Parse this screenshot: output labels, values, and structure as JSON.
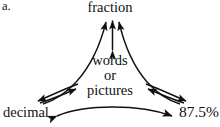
{
  "item_letter": "a.",
  "diagram": {
    "type": "concept-map-triangle",
    "stroke_color": "#111111",
    "background_color": "#ffffff",
    "nodes": [
      {
        "id": "fraction",
        "label": "fraction",
        "position": "top"
      },
      {
        "id": "center",
        "label": "words or pictures",
        "position": "center",
        "lines": [
          "words",
          "or",
          "pictures"
        ]
      },
      {
        "id": "decimal",
        "label": "decimal",
        "position": "bottom-left"
      },
      {
        "id": "percent",
        "label": "87.5%",
        "position": "bottom-right"
      }
    ],
    "connections": [
      {
        "from": "center",
        "to": "fraction",
        "style": "straight",
        "arrows": "double"
      },
      {
        "from": "center",
        "to": "decimal",
        "style": "straight",
        "arrows": "double"
      },
      {
        "from": "center",
        "to": "percent",
        "style": "straight",
        "arrows": "double"
      },
      {
        "from": "fraction",
        "to": "decimal",
        "style": "curved",
        "arrows": "single"
      },
      {
        "from": "fraction",
        "to": "percent",
        "style": "curved",
        "arrows": "single"
      },
      {
        "from": "decimal",
        "to": "percent",
        "style": "curved",
        "arrows": "double"
      }
    ]
  }
}
